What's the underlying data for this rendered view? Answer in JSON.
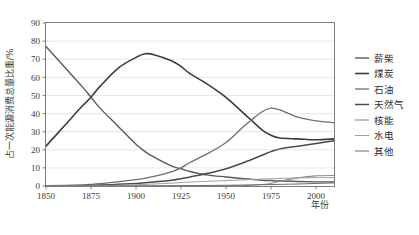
{
  "chart_data": {
    "type": "line",
    "title": "",
    "subtitle": "",
    "xlabel": "年份",
    "ylabel": "占一次能源消费总量比重/%",
    "xlim": [
      1850,
      2010
    ],
    "ylim": [
      0,
      90
    ],
    "xticks": [
      1850,
      1875,
      1900,
      1925,
      1950,
      1975,
      2000
    ],
    "xticklabels": [
      "1850",
      "1875",
      "1900",
      "1925",
      "1950",
      "1975",
      "2000"
    ],
    "yticks": [
      0,
      10,
      20,
      30,
      40,
      50,
      60,
      70,
      80,
      90
    ],
    "yticklabels": [
      "0",
      "10",
      "20",
      "30",
      "40",
      "50",
      "60",
      "70",
      "80",
      "90"
    ],
    "grid": "horizontal",
    "legend_position": "right",
    "x": [
      1850,
      1860,
      1870,
      1875,
      1880,
      1890,
      1900,
      1905,
      1910,
      1920,
      1925,
      1930,
      1940,
      1950,
      1960,
      1970,
      1975,
      1980,
      1990,
      2000,
      2010
    ],
    "series": [
      {
        "name": "薪柴",
        "color": "#5a5a5a",
        "width": 1.4,
        "values": [
          77,
          66,
          55,
          49,
          43,
          33,
          23,
          19,
          16,
          11,
          9.5,
          8,
          6,
          5,
          4,
          3.2,
          3,
          2.8,
          2.5,
          2.3,
          2.2
        ]
      },
      {
        "name": "煤炭",
        "color": "#3d3d3d",
        "width": 1.6,
        "values": [
          22,
          33,
          44,
          49,
          55,
          65,
          71,
          73,
          72.5,
          69,
          66,
          62,
          56,
          49,
          40,
          31,
          28,
          26.5,
          26,
          25.5,
          26
        ]
      },
      {
        "name": "石油",
        "color": "#6f6f6f",
        "width": 1.3,
        "values": [
          0.2,
          0.3,
          0.6,
          0.9,
          1.3,
          2.3,
          3.5,
          4.3,
          5.3,
          8,
          10,
          13,
          18,
          24,
          33,
          41,
          43,
          42,
          38,
          36,
          35
        ]
      },
      {
        "name": "天然气",
        "color": "#4a4a4a",
        "width": 1.5,
        "values": [
          0,
          0.1,
          0.2,
          0.3,
          0.5,
          0.9,
          1.4,
          1.8,
          2.2,
          3.2,
          4,
          5,
          7,
          9.5,
          13,
          17,
          19,
          20.5,
          22,
          23.5,
          25
        ]
      },
      {
        "name": "核能",
        "color": "#8c8c8c",
        "width": 1.1,
        "values": [
          0,
          0,
          0,
          0,
          0,
          0,
          0,
          0,
          0,
          0,
          0,
          0,
          0,
          0,
          0.2,
          0.8,
          1.5,
          2.6,
          4.5,
          5.6,
          5.8
        ]
      },
      {
        "name": "水电",
        "color": "#a0a0a0",
        "width": 1.0,
        "values": [
          0,
          0,
          0.05,
          0.1,
          0.2,
          0.4,
          0.7,
          0.9,
          1.1,
          1.6,
          1.9,
          2.2,
          2.6,
          3.0,
          3.4,
          3.8,
          4.0,
          4.2,
          4.5,
          4.6,
          4.7
        ]
      },
      {
        "name": "其他",
        "color": "#6a6a6a",
        "width": 1.0,
        "values": [
          0,
          0,
          0,
          0,
          0,
          0,
          0.05,
          0.07,
          0.1,
          0.15,
          0.2,
          0.25,
          0.3,
          0.4,
          0.5,
          0.7,
          0.8,
          0.9,
          1.1,
          1.4,
          1.7
        ]
      }
    ]
  },
  "legend": {
    "items": [
      {
        "label": "薪柴",
        "color": "#5a5a5a"
      },
      {
        "label": "煤炭",
        "color": "#3d3d3d"
      },
      {
        "label": "石油",
        "color": "#6f6f6f"
      },
      {
        "label": "天然气",
        "color": "#4a4a4a"
      },
      {
        "label": "核能",
        "color": "#8c8c8c"
      },
      {
        "label": "水电",
        "color": "#a0a0a0"
      },
      {
        "label": "其他",
        "color": "#6a6a6a"
      }
    ]
  },
  "axes": {
    "x_title": "年份",
    "y_title": "占一次能源消费总量比重/%"
  }
}
